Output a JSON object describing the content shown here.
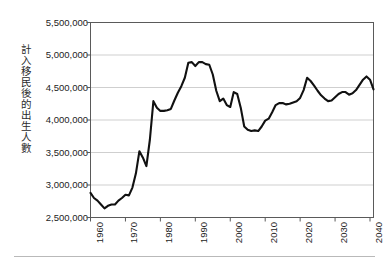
{
  "chart_data": {
    "type": "line",
    "title": "",
    "xlabel": "",
    "ylabel": "計入移民後的出生人數",
    "xlim": [
      1960,
      2041
    ],
    "ylim": [
      2500000,
      5500000
    ],
    "y_tick_step": 500000,
    "y_ticks": [
      "2,500,000",
      "3,000,000",
      "3,500,000",
      "4,000,000",
      "4,500,000",
      "5,000,000",
      "5,500,000"
    ],
    "y_tick_values": [
      2500000,
      3000000,
      3500000,
      4000000,
      4500000,
      5000000,
      5500000
    ],
    "x_ticks": [
      "1960",
      "1970",
      "1980",
      "1990",
      "2000",
      "2010",
      "2020",
      "2030",
      "2040"
    ],
    "x_tick_values": [
      1960,
      1970,
      1980,
      1990,
      2000,
      2010,
      2020,
      2030,
      2040
    ],
    "grid": "horizontal",
    "legend": "none",
    "line_color": "#111111",
    "line_width": 2.1,
    "plot_border_color": "#5a5a5a",
    "grid_color": "#cfcfcf",
    "series": [
      {
        "name": "計入移民後的出生人數",
        "x": [
          1960,
          1961,
          1962,
          1963,
          1964,
          1965,
          1966,
          1967,
          1968,
          1969,
          1970,
          1971,
          1972,
          1973,
          1974,
          1975,
          1976,
          1977,
          1978,
          1979,
          1980,
          1981,
          1982,
          1983,
          1984,
          1985,
          1986,
          1987,
          1988,
          1989,
          1990,
          1991,
          1992,
          1993,
          1994,
          1995,
          1996,
          1997,
          1998,
          1999,
          2000,
          2001,
          2002,
          2003,
          2004,
          2005,
          2006,
          2007,
          2008,
          2009,
          2010,
          2011,
          2012,
          2013,
          2014,
          2015,
          2016,
          2017,
          2018,
          2019,
          2020,
          2021,
          2022,
          2023,
          2024,
          2025,
          2026,
          2027,
          2028,
          2029,
          2030,
          2031,
          2032,
          2033,
          2034,
          2035,
          2036,
          2037,
          2038,
          2039,
          2040,
          2041
        ],
        "values": [
          2880000,
          2800000,
          2760000,
          2700000,
          2640000,
          2680000,
          2700000,
          2700000,
          2760000,
          2800000,
          2850000,
          2840000,
          2960000,
          3180000,
          3520000,
          3420000,
          3290000,
          3700000,
          4290000,
          4190000,
          4140000,
          4140000,
          4150000,
          4170000,
          4300000,
          4420000,
          4520000,
          4650000,
          4880000,
          4890000,
          4830000,
          4890000,
          4890000,
          4860000,
          4850000,
          4700000,
          4450000,
          4290000,
          4330000,
          4230000,
          4200000,
          4430000,
          4400000,
          4190000,
          3900000,
          3850000,
          3830000,
          3840000,
          3830000,
          3900000,
          3990000,
          4020000,
          4120000,
          4230000,
          4260000,
          4260000,
          4240000,
          4250000,
          4270000,
          4290000,
          4340000,
          4460000,
          4650000,
          4600000,
          4530000,
          4450000,
          4380000,
          4330000,
          4290000,
          4300000,
          4350000,
          4400000,
          4430000,
          4430000,
          4390000,
          4410000,
          4460000,
          4540000,
          4620000,
          4670000,
          4620000,
          4470000
        ]
      }
    ]
  }
}
